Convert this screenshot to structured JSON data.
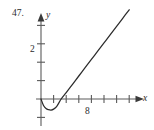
{
  "figure": {
    "exercise_number": "47.",
    "axis_labels": {
      "x": "x",
      "y": "y"
    },
    "tick_labels": {
      "y_two": "2",
      "x_eight": "8"
    }
  },
  "chart_data": {
    "type": "line",
    "title": "",
    "xlabel": "x",
    "ylabel": "y",
    "grid": false,
    "legend": null,
    "xlim": [
      -1,
      16
    ],
    "ylim": [
      -1.2,
      5.2
    ],
    "x_ticks": [
      2,
      4,
      6,
      8,
      10,
      12,
      14
    ],
    "x_tick_labels": [
      "",
      "",
      "",
      "8",
      "",
      "",
      ""
    ],
    "y_ticks": [
      1,
      2,
      3,
      4
    ],
    "y_tick_labels": [
      "",
      "2",
      "",
      ""
    ],
    "axes_style": "arrow-tipped cartesian axes through origin",
    "series": [
      {
        "name": "curve",
        "description": "Curve starting at the origin, dipping below the x-axis to a minimum near x=1.6, crossing the x-axis near x=3.2, then increasing and rising steeply toward the upper right.",
        "x": [
          0,
          0.4,
          0.8,
          1.2,
          1.6,
          2.0,
          2.5,
          3.2,
          4.0,
          5.0,
          6.0,
          7.0,
          8.0,
          9.0,
          10.0,
          11.0,
          12.0,
          13.0,
          14.0
        ],
        "y": [
          0.0,
          -0.35,
          -0.52,
          -0.58,
          -0.6,
          -0.55,
          -0.4,
          0.0,
          0.35,
          0.8,
          1.25,
          1.7,
          2.15,
          2.6,
          3.05,
          3.5,
          3.95,
          4.4,
          4.85
        ]
      }
    ],
    "annotations": []
  },
  "colors": {
    "ink": "#2b2b2b",
    "axis": "#5a5a5a",
    "curve": "#2b2b2b",
    "background": "#ffffff"
  }
}
